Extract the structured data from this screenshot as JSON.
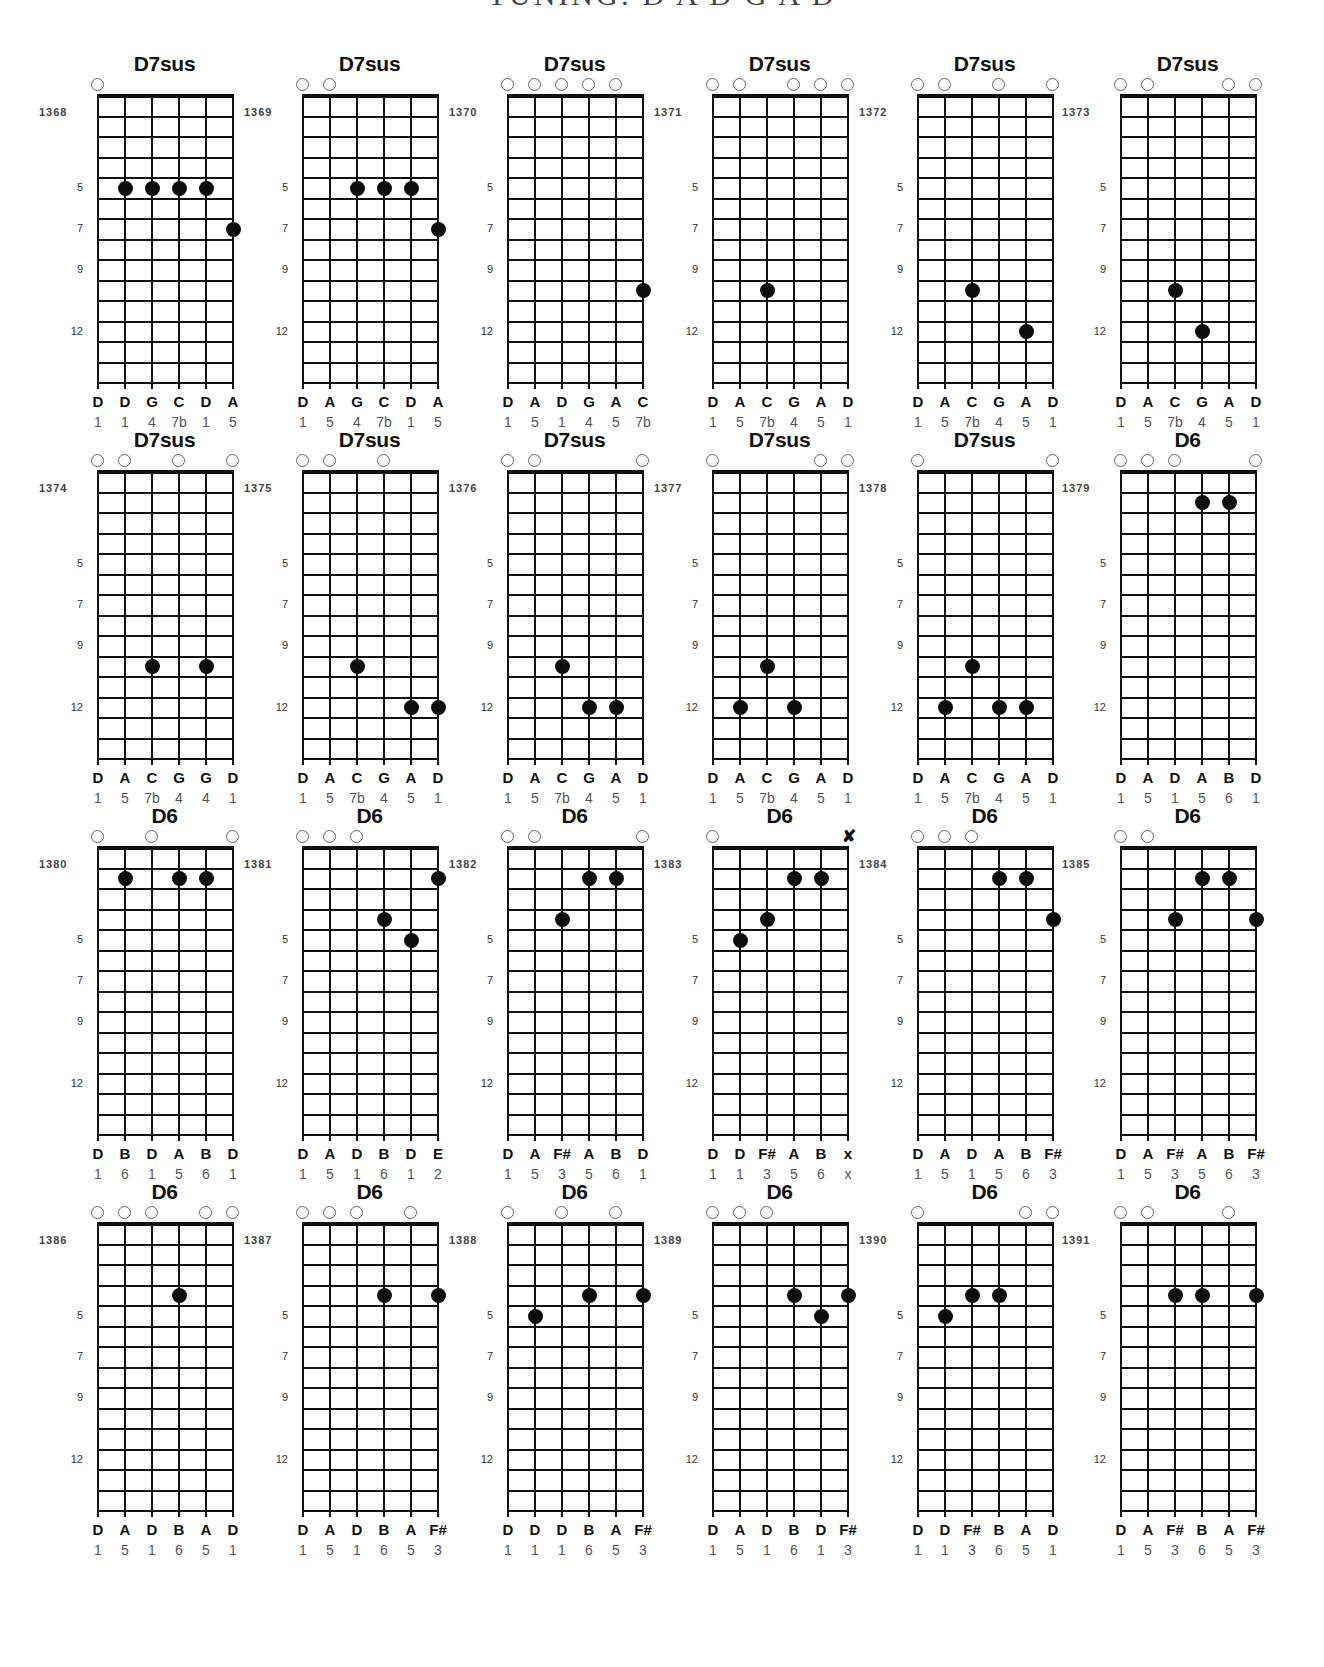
{
  "page": {
    "title": "TUNING: D A D G A D"
  },
  "layout": {
    "string_spacing": 27,
    "fret_spacing": 20.5,
    "num_frets": 14,
    "fret_markers": [
      5,
      7,
      9,
      12
    ]
  },
  "diagrams": [
    {
      "number": "1368",
      "chord": "D7sus",
      "open": [
        0
      ],
      "muted": [],
      "dots": [
        [
          1,
          5
        ],
        [
          2,
          5
        ],
        [
          3,
          5
        ],
        [
          4,
          5
        ],
        [
          5,
          7
        ]
      ],
      "notes": [
        "D",
        "D",
        "G",
        "C",
        "D",
        "A"
      ],
      "degrees": [
        "1",
        "1",
        "4",
        "7b",
        "1",
        "5"
      ],
      "fret_labels": [
        "5",
        "7",
        "9",
        "12"
      ]
    },
    {
      "number": "1369",
      "chord": "D7sus",
      "open": [
        0,
        1
      ],
      "muted": [],
      "dots": [
        [
          2,
          5
        ],
        [
          3,
          5
        ],
        [
          4,
          5
        ],
        [
          5,
          7
        ]
      ],
      "notes": [
        "D",
        "A",
        "G",
        "C",
        "D",
        "A"
      ],
      "degrees": [
        "1",
        "5",
        "4",
        "7b",
        "1",
        "5"
      ],
      "fret_labels": [
        "5",
        "7",
        "9",
        "12"
      ]
    },
    {
      "number": "1370",
      "chord": "D7sus",
      "open": [
        0,
        1,
        2,
        3,
        4
      ],
      "muted": [],
      "dots": [
        [
          5,
          10
        ]
      ],
      "notes": [
        "D",
        "A",
        "D",
        "G",
        "A",
        "C"
      ],
      "degrees": [
        "1",
        "5",
        "1",
        "4",
        "5",
        "7b"
      ],
      "fret_labels": [
        "5",
        "7",
        "9",
        "12"
      ]
    },
    {
      "number": "1371",
      "chord": "D7sus",
      "open": [
        0,
        1,
        3,
        4,
        5
      ],
      "muted": [],
      "dots": [
        [
          2,
          10
        ]
      ],
      "notes": [
        "D",
        "A",
        "C",
        "G",
        "A",
        "D"
      ],
      "degrees": [
        "1",
        "5",
        "7b",
        "4",
        "5",
        "1"
      ],
      "fret_labels": [
        "5",
        "7",
        "9",
        "12"
      ]
    },
    {
      "number": "1372",
      "chord": "D7sus",
      "open": [
        0,
        1,
        3,
        5
      ],
      "muted": [],
      "dots": [
        [
          2,
          10
        ],
        [
          4,
          12
        ]
      ],
      "notes": [
        "D",
        "A",
        "C",
        "G",
        "A",
        "D"
      ],
      "degrees": [
        "1",
        "5",
        "7b",
        "4",
        "5",
        "1"
      ],
      "fret_labels": [
        "5",
        "7",
        "9",
        "12"
      ]
    },
    {
      "number": "1373",
      "chord": "D7sus",
      "open": [
        0,
        1,
        4,
        5
      ],
      "muted": [],
      "dots": [
        [
          2,
          10
        ],
        [
          3,
          12
        ]
      ],
      "notes": [
        "D",
        "A",
        "C",
        "G",
        "A",
        "D"
      ],
      "degrees": [
        "1",
        "5",
        "7b",
        "4",
        "5",
        "1"
      ],
      "fret_labels": [
        "5",
        "7",
        "9",
        "12"
      ]
    },
    {
      "number": "1374",
      "chord": "D7sus",
      "open": [
        0,
        1,
        3,
        5
      ],
      "muted": [],
      "dots": [
        [
          2,
          10
        ],
        [
          4,
          10
        ]
      ],
      "notes": [
        "D",
        "A",
        "C",
        "G",
        "G",
        "D"
      ],
      "degrees": [
        "1",
        "5",
        "7b",
        "4",
        "4",
        "1"
      ],
      "fret_labels": [
        "5",
        "7",
        "9",
        "12"
      ]
    },
    {
      "number": "1375",
      "chord": "D7sus",
      "open": [
        0,
        1,
        3
      ],
      "muted": [],
      "dots": [
        [
          2,
          10
        ],
        [
          4,
          12
        ],
        [
          5,
          12
        ]
      ],
      "notes": [
        "D",
        "A",
        "C",
        "G",
        "A",
        "D"
      ],
      "degrees": [
        "1",
        "5",
        "7b",
        "4",
        "5",
        "1"
      ],
      "fret_labels": [
        "5",
        "7",
        "9",
        "12"
      ]
    },
    {
      "number": "1376",
      "chord": "D7sus",
      "open": [
        0,
        1,
        5
      ],
      "muted": [],
      "dots": [
        [
          2,
          10
        ],
        [
          3,
          12
        ],
        [
          4,
          12
        ]
      ],
      "notes": [
        "D",
        "A",
        "C",
        "G",
        "A",
        "D"
      ],
      "degrees": [
        "1",
        "5",
        "7b",
        "4",
        "5",
        "1"
      ],
      "fret_labels": [
        "5",
        "7",
        "9",
        "12"
      ]
    },
    {
      "number": "1377",
      "chord": "D7sus",
      "open": [
        0,
        4,
        5
      ],
      "muted": [],
      "dots": [
        [
          1,
          12
        ],
        [
          2,
          10
        ],
        [
          3,
          12
        ]
      ],
      "notes": [
        "D",
        "A",
        "C",
        "G",
        "A",
        "D"
      ],
      "degrees": [
        "1",
        "5",
        "7b",
        "4",
        "5",
        "1"
      ],
      "fret_labels": [
        "5",
        "7",
        "9",
        "12"
      ]
    },
    {
      "number": "1378",
      "chord": "D7sus",
      "open": [
        0,
        5
      ],
      "muted": [],
      "dots": [
        [
          1,
          12
        ],
        [
          2,
          10
        ],
        [
          3,
          12
        ],
        [
          4,
          12
        ]
      ],
      "notes": [
        "D",
        "A",
        "C",
        "G",
        "A",
        "D"
      ],
      "degrees": [
        "1",
        "5",
        "7b",
        "4",
        "5",
        "1"
      ],
      "fret_labels": [
        "5",
        "7",
        "9",
        "12"
      ]
    },
    {
      "number": "1379",
      "chord": "D6",
      "open": [
        0,
        1,
        2,
        5
      ],
      "muted": [],
      "dots": [
        [
          3,
          2
        ],
        [
          4,
          2
        ]
      ],
      "notes": [
        "D",
        "A",
        "D",
        "A",
        "B",
        "D"
      ],
      "degrees": [
        "1",
        "5",
        "1",
        "5",
        "6",
        "1"
      ],
      "fret_labels": [
        "5",
        "7",
        "9",
        "12"
      ]
    },
    {
      "number": "1380",
      "chord": "D6",
      "open": [
        0,
        2,
        5
      ],
      "muted": [],
      "dots": [
        [
          1,
          2
        ],
        [
          3,
          2
        ],
        [
          4,
          2
        ]
      ],
      "notes": [
        "D",
        "B",
        "D",
        "A",
        "B",
        "D"
      ],
      "degrees": [
        "1",
        "6",
        "1",
        "5",
        "6",
        "1"
      ],
      "fret_labels": [
        "5",
        "7",
        "9",
        "12"
      ]
    },
    {
      "number": "1381",
      "chord": "D6",
      "open": [
        0,
        1,
        2
      ],
      "muted": [],
      "dots": [
        [
          3,
          4
        ],
        [
          4,
          5
        ],
        [
          5,
          2
        ]
      ],
      "notes": [
        "D",
        "A",
        "D",
        "B",
        "D",
        "E"
      ],
      "degrees": [
        "1",
        "5",
        "1",
        "6",
        "1",
        "2"
      ],
      "fret_labels": [
        "5",
        "7",
        "9",
        "12"
      ]
    },
    {
      "number": "1382",
      "chord": "D6",
      "open": [
        0,
        1,
        5
      ],
      "muted": [],
      "dots": [
        [
          2,
          4
        ],
        [
          3,
          2
        ],
        [
          4,
          2
        ]
      ],
      "notes": [
        "D",
        "A",
        "F#",
        "A",
        "B",
        "D"
      ],
      "degrees": [
        "1",
        "5",
        "3",
        "5",
        "6",
        "1"
      ],
      "fret_labels": [
        "5",
        "7",
        "9",
        "12"
      ]
    },
    {
      "number": "1383",
      "chord": "D6",
      "open": [
        0
      ],
      "muted": [
        5
      ],
      "dots": [
        [
          1,
          5
        ],
        [
          2,
          4
        ],
        [
          3,
          2
        ],
        [
          4,
          2
        ]
      ],
      "notes": [
        "D",
        "D",
        "F#",
        "A",
        "B",
        "x"
      ],
      "degrees": [
        "1",
        "1",
        "3",
        "5",
        "6",
        "x"
      ],
      "fret_labels": [
        "5",
        "7",
        "9",
        "12"
      ]
    },
    {
      "number": "1384",
      "chord": "D6",
      "open": [
        0,
        1,
        2
      ],
      "muted": [],
      "dots": [
        [
          3,
          2
        ],
        [
          4,
          2
        ],
        [
          5,
          4
        ]
      ],
      "notes": [
        "D",
        "A",
        "D",
        "A",
        "B",
        "F#"
      ],
      "degrees": [
        "1",
        "5",
        "1",
        "5",
        "6",
        "3"
      ],
      "fret_labels": [
        "5",
        "7",
        "9",
        "12"
      ]
    },
    {
      "number": "1385",
      "chord": "D6",
      "open": [
        0,
        1
      ],
      "muted": [],
      "dots": [
        [
          2,
          4
        ],
        [
          3,
          2
        ],
        [
          4,
          2
        ],
        [
          5,
          4
        ]
      ],
      "notes": [
        "D",
        "A",
        "F#",
        "A",
        "B",
        "F#"
      ],
      "degrees": [
        "1",
        "5",
        "3",
        "5",
        "6",
        "3"
      ],
      "fret_labels": [
        "5",
        "7",
        "9",
        "12"
      ]
    },
    {
      "number": "1386",
      "chord": "D6",
      "open": [
        0,
        1,
        2,
        4,
        5
      ],
      "muted": [],
      "dots": [
        [
          3,
          4
        ]
      ],
      "notes": [
        "D",
        "A",
        "D",
        "B",
        "A",
        "D"
      ],
      "degrees": [
        "1",
        "5",
        "1",
        "6",
        "5",
        "1"
      ],
      "fret_labels": [
        "5",
        "7",
        "9",
        "12"
      ]
    },
    {
      "number": "1387",
      "chord": "D6",
      "open": [
        0,
        1,
        2,
        4
      ],
      "muted": [],
      "dots": [
        [
          3,
          4
        ],
        [
          5,
          4
        ]
      ],
      "notes": [
        "D",
        "A",
        "D",
        "B",
        "A",
        "F#"
      ],
      "degrees": [
        "1",
        "5",
        "1",
        "6",
        "5",
        "3"
      ],
      "fret_labels": [
        "5",
        "7",
        "9",
        "12"
      ]
    },
    {
      "number": "1388",
      "chord": "D6",
      "open": [
        0,
        2,
        4
      ],
      "muted": [],
      "dots": [
        [
          1,
          5
        ],
        [
          3,
          4
        ],
        [
          5,
          4
        ]
      ],
      "notes": [
        "D",
        "D",
        "D",
        "B",
        "A",
        "F#"
      ],
      "degrees": [
        "1",
        "1",
        "1",
        "6",
        "5",
        "3"
      ],
      "fret_labels": [
        "5",
        "7",
        "9",
        "12"
      ]
    },
    {
      "number": "1389",
      "chord": "D6",
      "open": [
        0,
        1,
        2
      ],
      "muted": [],
      "dots": [
        [
          3,
          4
        ],
        [
          4,
          5
        ],
        [
          5,
          4
        ]
      ],
      "notes": [
        "D",
        "A",
        "D",
        "B",
        "D",
        "F#"
      ],
      "degrees": [
        "1",
        "5",
        "1",
        "6",
        "1",
        "3"
      ],
      "fret_labels": [
        "5",
        "7",
        "9",
        "12"
      ]
    },
    {
      "number": "1390",
      "chord": "D6",
      "open": [
        0,
        4,
        5
      ],
      "muted": [],
      "dots": [
        [
          1,
          5
        ],
        [
          2,
          4
        ],
        [
          3,
          4
        ]
      ],
      "notes": [
        "D",
        "D",
        "F#",
        "B",
        "A",
        "D"
      ],
      "degrees": [
        "1",
        "1",
        "3",
        "6",
        "5",
        "1"
      ],
      "fret_labels": [
        "5",
        "7",
        "9",
        "12"
      ]
    },
    {
      "number": "1391",
      "chord": "D6",
      "open": [
        0,
        1,
        4
      ],
      "muted": [],
      "dots": [
        [
          2,
          4
        ],
        [
          3,
          4
        ],
        [
          5,
          4
        ]
      ],
      "notes": [
        "D",
        "A",
        "F#",
        "B",
        "A",
        "F#"
      ],
      "degrees": [
        "1",
        "5",
        "3",
        "6",
        "5",
        "3"
      ],
      "fret_labels": [
        "5",
        "7",
        "9",
        "12"
      ]
    }
  ]
}
